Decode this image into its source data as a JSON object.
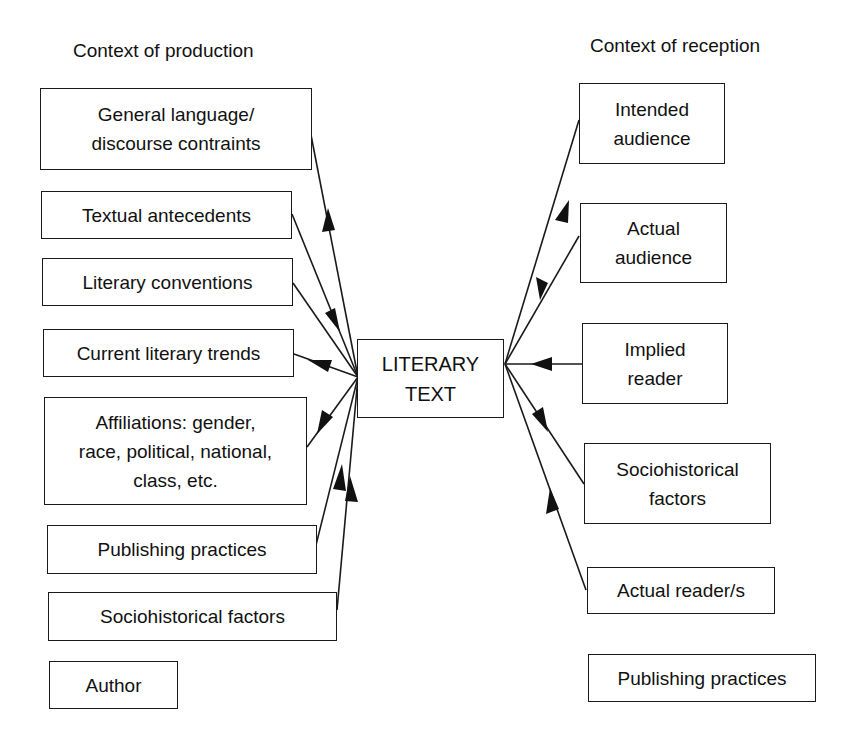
{
  "diagram": {
    "left_heading": "Context of production",
    "right_heading": "Context of reception",
    "center": {
      "line1": "LITERARY",
      "line2": "TEXT"
    },
    "production": [
      {
        "id": "general-language",
        "lines": [
          "General language/",
          "discourse contraints"
        ],
        "arrow": "from-text"
      },
      {
        "id": "textual-antecedents",
        "lines": [
          "Textual antecedents"
        ],
        "arrow": "none"
      },
      {
        "id": "literary-conventions",
        "lines": [
          "Literary conventions"
        ],
        "arrow": "to-text"
      },
      {
        "id": "current-literary-trends",
        "lines": [
          "Current literary trends"
        ],
        "arrow": "from-text"
      },
      {
        "id": "affiliations",
        "lines": [
          "Affiliations: gender,",
          "race, political, national,",
          "class, etc."
        ],
        "arrow": "to-text"
      },
      {
        "id": "publishing-practices",
        "lines": [
          "Publishing practices"
        ],
        "arrow": "from-text"
      },
      {
        "id": "sociohistorical-factors",
        "lines": [
          "Sociohistorical factors"
        ],
        "arrow": "from-text"
      },
      {
        "id": "author",
        "lines": [
          "Author"
        ],
        "arrow": "none"
      }
    ],
    "reception": [
      {
        "id": "intended-audience",
        "lines": [
          "Intended",
          "audience"
        ],
        "arrow": "from-text"
      },
      {
        "id": "actual-audience",
        "lines": [
          "Actual",
          "audience"
        ],
        "arrow": "to-text"
      },
      {
        "id": "implied-reader",
        "lines": [
          "Implied",
          "reader"
        ],
        "arrow": "to-text"
      },
      {
        "id": "sociohistorical-factors-r",
        "lines": [
          "Sociohistorical",
          "factors"
        ],
        "arrow": "to-box"
      },
      {
        "id": "actual-readers",
        "lines": [
          "Actual reader/s"
        ],
        "arrow": "from-text"
      },
      {
        "id": "publishing-practices-r",
        "lines": [
          "Publishing practices"
        ],
        "arrow": "none"
      }
    ]
  }
}
